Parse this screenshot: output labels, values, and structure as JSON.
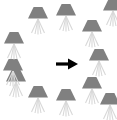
{
  "figure": {
    "type": "icon-ring-diagram",
    "background_color": "#ffffff",
    "width": 117,
    "height": 120
  },
  "icons": {
    "lamp": {
      "name": "lamp-icon",
      "shade_color": "#808080",
      "rays_color": "#d8d8d8",
      "count": 12
    },
    "arrow": {
      "name": "arrow-right-icon",
      "color": "#000000",
      "direction": "right"
    }
  },
  "ring": {
    "center_x": 58,
    "center_y": 60,
    "radius_x": 44,
    "radius_y": 44,
    "items": [
      {
        "label": "lamp-1",
        "x": 38,
        "y": 20
      },
      {
        "label": "lamp-2",
        "x": 66,
        "y": 17
      },
      {
        "label": "lamp-3",
        "x": 92,
        "y": 33
      },
      {
        "label": "lamp-4",
        "x": 99,
        "y": 62
      },
      {
        "label": "lamp-5",
        "x": 92,
        "y": 90
      },
      {
        "label": "lamp-6",
        "x": 66,
        "y": 102
      },
      {
        "label": "lamp-7",
        "x": 38,
        "y": 99
      },
      {
        "label": "lamp-8",
        "x": 16,
        "y": 83
      },
      {
        "label": "lamp-9",
        "x": 13,
        "y": 72
      },
      {
        "label": "lamp-10",
        "x": 14,
        "y": 45
      },
      {
        "label": "lamp-11",
        "x": 113,
        "y": 12
      },
      {
        "label": "lamp-12",
        "x": 110,
        "y": 106
      }
    ]
  },
  "arrow_marker": {
    "x": 67,
    "y": 64
  }
}
